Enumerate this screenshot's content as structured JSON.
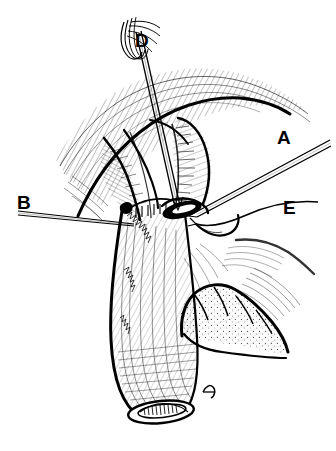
{
  "figure": {
    "kind": "surgical-line-illustration",
    "medium": "pen-and-ink black line art",
    "background_color": "#ffffff",
    "ink_color": "#000000",
    "width": 336,
    "height": 451,
    "caption": ""
  },
  "labels": [
    {
      "id": "A",
      "text": "A",
      "x": 277,
      "y": 128,
      "points_to": "straight double-line instrument (needle holder / forceps) entering the stoma from the upper right"
    },
    {
      "id": "B",
      "text": "B",
      "x": 17,
      "y": 193,
      "points_to": "thin straight suture thread extending to the left from the stoma"
    },
    {
      "id": "D",
      "text": "D",
      "x": 135,
      "y": 31,
      "points_to": "suture loop / thread bundle at the top of the long vertical instrument shaft"
    },
    {
      "id": "E",
      "text": "E",
      "x": 283,
      "y": 198,
      "points_to": "curved suture thread sweeping to the right from the stoma"
    }
  ],
  "structures": [
    {
      "name": "tubular-organ",
      "description": "large hatch-shaded tubular segment running from the stoma down and slightly left to a rounded distal end"
    },
    {
      "name": "stoma-opening",
      "description": "solid black elliptical opening at the upper end of the tubular organ"
    },
    {
      "name": "distal-oval-opening",
      "description": "small oval lumen with internal cross-hatch at the lower end of the tubular segment"
    },
    {
      "name": "upper-tissue-fold",
      "description": "sweeping hatched tissue fold arching across the upper third of the drawing"
    },
    {
      "name": "lobed-tissue-mass",
      "description": "stippled lobed tissue mass at lower right adjacent to the tubular organ"
    },
    {
      "name": "instrument-shaft",
      "description": "long thin straight shaft running from the upper left down to the stoma"
    }
  ]
}
